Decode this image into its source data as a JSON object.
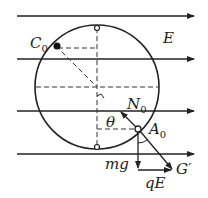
{
  "diagram": {
    "field_label": "E",
    "labels": {
      "C0": {
        "main": "C",
        "sub": "0"
      },
      "N0": {
        "main": "N",
        "sub": "0"
      },
      "A0": {
        "main": "A",
        "sub": "0"
      },
      "theta": "θ",
      "mg": "mg",
      "qE": "qE",
      "G_prime": "G′"
    },
    "field_lines_y": [
      16,
      59,
      111,
      154
    ],
    "circle": {
      "cx": 97,
      "cy": 87,
      "r": 62
    },
    "colors": {
      "ink": "#222222",
      "background": "#ffffff"
    }
  }
}
